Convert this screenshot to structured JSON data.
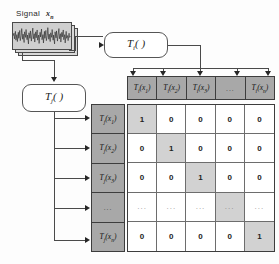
{
  "diagram": {
    "signal": {
      "label_text": "Signal",
      "variable": "x",
      "variable_sub": "n",
      "panel_count": 3
    },
    "boxes": {
      "ti": {
        "name": "T",
        "sub": "i",
        "suffix": "( )"
      },
      "tj": {
        "name": "T",
        "sub": "j",
        "suffix": "( )"
      }
    },
    "column_header": [
      {
        "name": "T",
        "sub": "i",
        "arg": "x",
        "arg_sub": "1",
        "text": "Ti(x1)",
        "is_ellipsis": false
      },
      {
        "name": "T",
        "sub": "i",
        "arg": "x",
        "arg_sub": "2",
        "text": "Ti(x2)",
        "is_ellipsis": false
      },
      {
        "name": "T",
        "sub": "i",
        "arg": "x",
        "arg_sub": "3",
        "text": "Ti(x3)",
        "is_ellipsis": false
      },
      {
        "text": "...",
        "is_ellipsis": true
      },
      {
        "name": "T",
        "sub": "i",
        "arg": "x",
        "arg_sub": "n",
        "text": "Ti(xn)",
        "is_ellipsis": false
      }
    ],
    "row_header": [
      {
        "name": "T",
        "sub": "j",
        "arg": "x",
        "arg_sub": "1",
        "text": "Tj(x1)",
        "is_ellipsis": false
      },
      {
        "name": "T",
        "sub": "j",
        "arg": "x",
        "arg_sub": "2",
        "text": "Tj(x2)",
        "is_ellipsis": false
      },
      {
        "name": "T",
        "sub": "j",
        "arg": "x",
        "arg_sub": "3",
        "text": "Tj(x3)",
        "is_ellipsis": false
      },
      {
        "text": "...",
        "is_ellipsis": true
      },
      {
        "name": "T",
        "sub": "j",
        "arg": "x",
        "arg_sub": "n",
        "text": "Tj(xn)",
        "is_ellipsis": false
      }
    ],
    "matrix": {
      "rows": 5,
      "cols": 5,
      "values": [
        [
          "1",
          "0",
          "0",
          "0",
          "0"
        ],
        [
          "0",
          "1",
          "0",
          "0",
          "0"
        ],
        [
          "0",
          "0",
          "1",
          "0",
          "0"
        ],
        [
          "...",
          "...",
          "...",
          "...",
          "..."
        ],
        [
          "0",
          "0",
          "0",
          "0",
          "1"
        ]
      ],
      "ellipsis_row_index": 3,
      "diagonal_highlight": [
        0,
        1,
        2,
        3,
        4
      ]
    },
    "colors": {
      "header_fill": "#a8a8a8",
      "diagonal_fill": "#d2d2d2",
      "cell_fill": "#ffffff",
      "signal_fill": "#cfcfcf",
      "line": "#4a4a4a",
      "border": "#3d3d3d"
    },
    "arrows": {
      "column_arrow_count": 5,
      "row_arrow_count": 5
    }
  }
}
